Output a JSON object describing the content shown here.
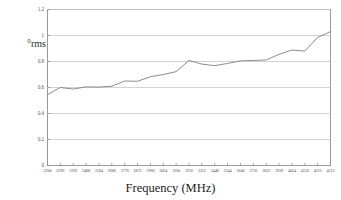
{
  "chart_data": {
    "type": "line",
    "title": "",
    "xlabel": "Frequency (MHz)",
    "ylabel": "°rms",
    "grid": true,
    "legend": "none",
    "xlim": [
      2200,
      4312
    ],
    "ylim": [
      0,
      1.2
    ],
    "ytick_labels": [
      "1.2",
      "1",
      "0.8",
      "0.6",
      "0.4",
      "0.2",
      "0"
    ],
    "ytick_values": [
      1.2,
      1.0,
      0.8,
      0.6,
      0.4,
      0.2,
      0
    ],
    "categories": [
      "2200",
      "2296",
      "2392",
      "2488",
      "2584",
      "2680",
      "2776",
      "2872",
      "2968",
      "3064",
      "3160",
      "3256",
      "3352",
      "3448",
      "3544",
      "3640",
      "3736",
      "3832",
      "3928",
      "4024",
      "4120",
      "4216",
      "4312"
    ],
    "x": [
      2200,
      2296,
      2392,
      2488,
      2584,
      2680,
      2776,
      2872,
      2968,
      3064,
      3160,
      3256,
      3352,
      3448,
      3544,
      3640,
      3736,
      3832,
      3928,
      4024,
      4120,
      4216,
      4312
    ],
    "series": [
      {
        "name": "phase noise rms",
        "color": "#808080",
        "values": [
          0.545,
          0.6,
          0.588,
          0.605,
          0.603,
          0.61,
          0.65,
          0.648,
          0.683,
          0.7,
          0.722,
          0.808,
          0.78,
          0.768,
          0.785,
          0.805,
          0.808,
          0.812,
          0.855,
          0.888,
          0.88,
          0.985,
          1.03
        ]
      }
    ]
  },
  "axes": {
    "frame_color": "#9a9a9a",
    "grid_color": "#c8c8c8",
    "tick_color": "#8a8a8a"
  }
}
